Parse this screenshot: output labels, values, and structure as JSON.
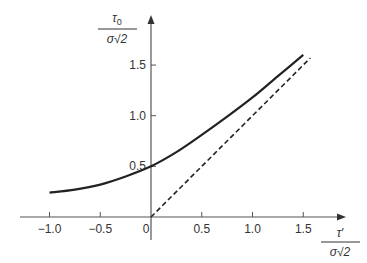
{
  "chart_data": {
    "type": "line",
    "title": "",
    "xlabel": "τ′ / (σ√2)",
    "ylabel": "τ0 / (σ√2)",
    "xlabel_parts": {
      "numerator": "τ′",
      "denominator": "σ√2"
    },
    "ylabel_parts": {
      "numerator": "τ",
      "numerator_sub": "0",
      "denominator": "σ√2"
    },
    "xlim": [
      -1.25,
      1.9
    ],
    "ylim": [
      0,
      1.95
    ],
    "x_ticks": [
      -1.0,
      -0.5,
      0,
      0.5,
      1.0,
      1.5
    ],
    "x_tick_labels": [
      "−1.0",
      "−0.5",
      "0",
      "0.5",
      "1.0",
      "1.5"
    ],
    "y_ticks": [
      0.5,
      1.0,
      1.5
    ],
    "y_tick_labels": [
      "0.5",
      "1.0",
      "1.5"
    ],
    "grid": false,
    "legend": null,
    "series": [
      {
        "name": "τ0 curve",
        "style": "solid",
        "color": "#222222",
        "x": [
          -1.0,
          -0.75,
          -0.5,
          -0.25,
          0,
          0.25,
          0.5,
          0.75,
          1.0,
          1.25,
          1.5
        ],
        "y": [
          0.24,
          0.27,
          0.32,
          0.4,
          0.5,
          0.64,
          0.81,
          0.99,
          1.18,
          1.39,
          1.6
        ]
      },
      {
        "name": "asymptote τ0 = τ′",
        "style": "dashed",
        "color": "#222222",
        "x": [
          0,
          1.57
        ],
        "y": [
          0,
          1.57
        ]
      }
    ]
  }
}
